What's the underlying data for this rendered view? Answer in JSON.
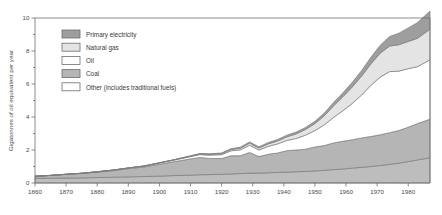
{
  "chart_data": {
    "type": "area",
    "title": "",
    "xlabel": "",
    "ylabel": "Gigatonnes of oil equivalent per year",
    "xlim": [
      1860,
      1987
    ],
    "ylim": [
      0,
      10
    ],
    "grid": false,
    "stacked": true,
    "legend_position": "upper-left",
    "y_ticks_major": [
      0,
      2,
      4,
      6,
      8,
      10
    ],
    "y_ticks_minor": [
      1,
      3,
      5,
      7,
      9
    ],
    "y_tick_labels": [
      "0",
      "2",
      "4",
      "6",
      "8",
      "10"
    ],
    "x_ticks": [
      1860,
      1870,
      1880,
      1890,
      1900,
      1910,
      1920,
      1930,
      1940,
      1950,
      1960,
      1970,
      1980
    ],
    "x_tick_labels": [
      "1860",
      "1870",
      "1880",
      "1890",
      "1900",
      "1910",
      "1920",
      "1930",
      "1940",
      "1950",
      "1960",
      "1970",
      "1980"
    ],
    "x": [
      1860,
      1865,
      1870,
      1875,
      1880,
      1885,
      1890,
      1895,
      1900,
      1905,
      1910,
      1913,
      1916,
      1920,
      1923,
      1926,
      1929,
      1932,
      1935,
      1938,
      1941,
      1944,
      1947,
      1950,
      1953,
      1956,
      1959,
      1962,
      1965,
      1968,
      1971,
      1974,
      1977,
      1980,
      1983,
      1987
    ],
    "series": [
      {
        "name": "Other (includes traditional fuels)",
        "color": "#bdbdbd",
        "values": [
          0.28,
          0.29,
          0.3,
          0.31,
          0.33,
          0.35,
          0.37,
          0.39,
          0.42,
          0.45,
          0.48,
          0.5,
          0.51,
          0.53,
          0.55,
          0.57,
          0.6,
          0.6,
          0.62,
          0.64,
          0.66,
          0.68,
          0.7,
          0.73,
          0.77,
          0.81,
          0.85,
          0.9,
          0.95,
          1.0,
          1.06,
          1.13,
          1.2,
          1.3,
          1.4,
          1.52
        ]
      },
      {
        "name": "Coal",
        "color": "#b5b5b5",
        "values": [
          0.13,
          0.17,
          0.22,
          0.27,
          0.33,
          0.4,
          0.5,
          0.58,
          0.72,
          0.85,
          0.98,
          1.05,
          0.98,
          0.95,
          1.1,
          1.08,
          1.25,
          1.0,
          1.12,
          1.18,
          1.3,
          1.32,
          1.35,
          1.45,
          1.5,
          1.62,
          1.68,
          1.72,
          1.78,
          1.82,
          1.86,
          1.92,
          1.98,
          2.08,
          2.2,
          2.35
        ]
      },
      {
        "name": "Oil",
        "color": "#ffffff",
        "values": [
          0.0,
          0.0,
          0.01,
          0.01,
          0.02,
          0.03,
          0.04,
          0.05,
          0.07,
          0.1,
          0.14,
          0.17,
          0.2,
          0.24,
          0.3,
          0.36,
          0.44,
          0.4,
          0.48,
          0.55,
          0.62,
          0.7,
          0.85,
          1.0,
          1.25,
          1.55,
          1.85,
          2.2,
          2.6,
          3.1,
          3.5,
          3.7,
          3.6,
          3.55,
          3.45,
          3.6
        ]
      },
      {
        "name": "Natural gas",
        "color": "#e4e4e4",
        "values": [
          0.0,
          0.0,
          0.0,
          0.0,
          0.0,
          0.0,
          0.0,
          0.01,
          0.01,
          0.02,
          0.03,
          0.04,
          0.05,
          0.06,
          0.08,
          0.1,
          0.13,
          0.12,
          0.15,
          0.18,
          0.22,
          0.28,
          0.35,
          0.42,
          0.55,
          0.7,
          0.85,
          1.0,
          1.15,
          1.3,
          1.45,
          1.55,
          1.6,
          1.65,
          1.72,
          1.85
        ]
      },
      {
        "name": "Primary electricity",
        "color": "#9e9e9e",
        "values": [
          0.0,
          0.0,
          0.0,
          0.0,
          0.0,
          0.0,
          0.0,
          0.0,
          0.01,
          0.01,
          0.02,
          0.03,
          0.03,
          0.04,
          0.05,
          0.06,
          0.07,
          0.07,
          0.08,
          0.09,
          0.1,
          0.11,
          0.12,
          0.14,
          0.17,
          0.2,
          0.24,
          0.28,
          0.33,
          0.4,
          0.48,
          0.58,
          0.7,
          0.82,
          0.95,
          1.1
        ]
      }
    ],
    "legend": [
      {
        "label": "Primary electricity",
        "color": "#9e9e9e"
      },
      {
        "label": "Natural gas",
        "color": "#e4e4e4"
      },
      {
        "label": "Oil",
        "color": "#ffffff"
      },
      {
        "label": "Coal",
        "color": "#b5b5b5"
      },
      {
        "label": "Other (includes traditional fuels)",
        "color": "#ffffff"
      }
    ]
  }
}
